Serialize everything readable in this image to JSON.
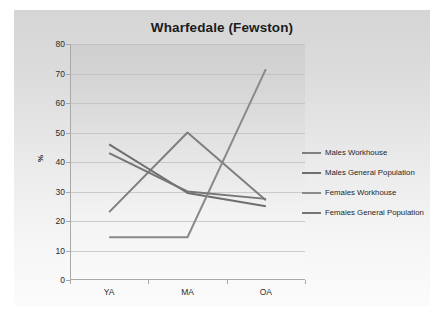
{
  "chart_data": {
    "type": "line",
    "title": "Wharfedale (Fewston)",
    "xlabel": "",
    "ylabel": "%",
    "categories": [
      "YA",
      "MA",
      "OA"
    ],
    "ylim": [
      0,
      80
    ],
    "yticks": [
      0,
      10,
      20,
      30,
      40,
      50,
      60,
      70,
      80
    ],
    "ytick_labels": [
      "0",
      "10",
      "20",
      "30",
      "40",
      "50",
      "60",
      "70",
      "80"
    ],
    "grid": true,
    "legend_position": "right",
    "series": [
      {
        "name": "Males Workhouse",
        "color": "#7f7f7f",
        "values": [
          23,
          50,
          27
        ]
      },
      {
        "name": "Males General Population",
        "color": "#6e6e6e",
        "values": [
          46,
          29.5,
          25
        ]
      },
      {
        "name": "Females Workhouse",
        "color": "#8a8a8a",
        "values": [
          14.5,
          14.5,
          71.5
        ]
      },
      {
        "name": "Females General Population",
        "color": "#767676",
        "values": [
          43,
          30,
          27.5
        ]
      }
    ]
  },
  "colors": {
    "plot_background": "#e3e3e3",
    "canvas_background": "#dcdcdc",
    "gridline": "#bdbdbd",
    "axis": "#a9a9a9",
    "text": "#1c1c1c"
  }
}
